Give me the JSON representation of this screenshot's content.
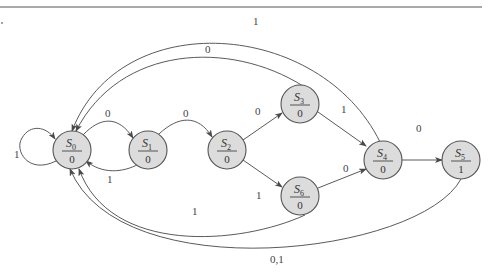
{
  "diagram": {
    "type": "finite-state-machine (Moore)",
    "colors": {
      "node_fill": "#dcdcdc",
      "node_stroke": "#555555",
      "edge": "#5a5a5a",
      "text": "#333333"
    },
    "states": [
      {
        "id": "S0",
        "name": "S",
        "sub": "0",
        "output": "0"
      },
      {
        "id": "S1",
        "name": "S",
        "sub": "1",
        "output": "0"
      },
      {
        "id": "S2",
        "name": "S",
        "sub": "2",
        "output": "0"
      },
      {
        "id": "S3",
        "name": "S",
        "sub": "3",
        "output": "0"
      },
      {
        "id": "S4",
        "name": "S",
        "sub": "4",
        "output": "0"
      },
      {
        "id": "S5",
        "name": "S",
        "sub": "5",
        "output": "1"
      },
      {
        "id": "S6",
        "name": "S",
        "sub": "6",
        "output": "0"
      }
    ],
    "transitions": [
      {
        "from": "S0",
        "to": "S0",
        "label": "1"
      },
      {
        "from": "S0",
        "to": "S1",
        "label": "0"
      },
      {
        "from": "S1",
        "to": "S0",
        "label": "1"
      },
      {
        "from": "S1",
        "to": "S2",
        "label": "0"
      },
      {
        "from": "S2",
        "to": "S3",
        "label": "0"
      },
      {
        "from": "S2",
        "to": "S6",
        "label": "1"
      },
      {
        "from": "S3",
        "to": "S4",
        "label": "1"
      },
      {
        "from": "S3",
        "to": "S0",
        "label": "0"
      },
      {
        "from": "S6",
        "to": "S4",
        "label": "0"
      },
      {
        "from": "S6",
        "to": "S0",
        "label": "1"
      },
      {
        "from": "S4",
        "to": "S5",
        "label": "0"
      },
      {
        "from": "S4",
        "to": "S0",
        "label": "1"
      },
      {
        "from": "S5",
        "to": "S0",
        "label": "0,1"
      }
    ]
  }
}
